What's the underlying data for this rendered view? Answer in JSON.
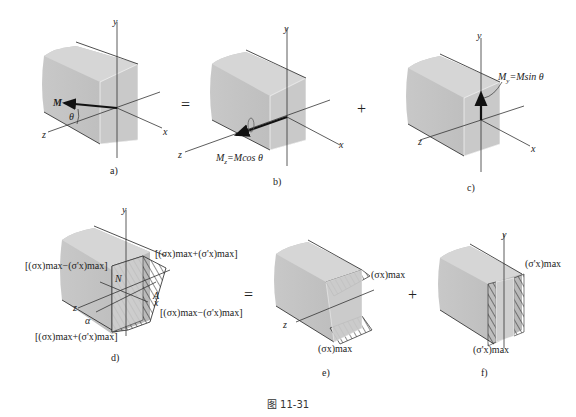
{
  "figure": {
    "caption": "图 11-31",
    "operators": {
      "eq1": "=",
      "plus1": "+",
      "eq2": "=",
      "plus2": "+"
    },
    "panels": {
      "a": {
        "label": "a)",
        "axis_x": "x",
        "axis_y": "y",
        "axis_z": "z",
        "moment": "M",
        "angle": "θ"
      },
      "b": {
        "label": "b)",
        "axis_x": "x",
        "axis_y": "y",
        "axis_z": "z",
        "moment_label": "M₂=Mcos θ",
        "moment_sym": "M",
        "moment_sub": "z",
        "moment_eq": "=Mcos θ"
      },
      "c": {
        "label": "c)",
        "axis_x": "x",
        "axis_y": "y",
        "axis_z": "z",
        "moment_sym": "M",
        "moment_sub": "y",
        "moment_eq": "=Msin θ"
      },
      "d": {
        "label": "d)",
        "axis_y": "y",
        "axis_z": "z",
        "axis_x": "x",
        "neutral_N": "N",
        "neutral_A": "A",
        "angle": "α",
        "stress_top_left": "[(σx)max−(σ'x)max]",
        "stress_top_right": "[(σx)max+(σ'x)max]",
        "stress_bottom_right": "[(σx)max−(σ'x)max]",
        "stress_bottom_left": "[(σx)max+(σ'x)max]"
      },
      "e": {
        "label": "e)",
        "axis_z": "z",
        "stress_top": "(σx)max",
        "stress_bottom": "(σx)max"
      },
      "f": {
        "label": "f)",
        "axis_y": "y",
        "stress_top": "(σ'x)max",
        "stress_bottom": "(σ'x)max"
      }
    }
  }
}
